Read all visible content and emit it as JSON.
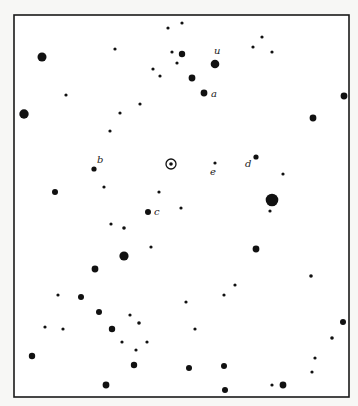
{
  "diagram": {
    "type": "star-map",
    "frame": {
      "x": 14,
      "y": 15,
      "width": 335,
      "height": 382
    },
    "sun": {
      "symbol": "⊙",
      "x": 171,
      "y": 164
    },
    "labels": [
      {
        "text": "u",
        "x": 214,
        "y": 54
      },
      {
        "text": "a",
        "x": 211,
        "y": 97
      },
      {
        "text": "b",
        "x": 97,
        "y": 163
      },
      {
        "text": "c",
        "x": 154,
        "y": 215
      },
      {
        "text": "d",
        "x": 245,
        "y": 167
      },
      {
        "text": "e",
        "x": 210,
        "y": 175
      }
    ],
    "stars": [
      {
        "x": 168,
        "y": 28,
        "r": 1.6
      },
      {
        "x": 182,
        "y": 23,
        "r": 1.6
      },
      {
        "x": 115,
        "y": 49,
        "r": 1.6
      },
      {
        "x": 42,
        "y": 57,
        "r": 4.5
      },
      {
        "x": 172,
        "y": 52,
        "r": 1.6
      },
      {
        "x": 182,
        "y": 54,
        "r": 3.2
      },
      {
        "x": 177,
        "y": 63,
        "r": 1.6
      },
      {
        "x": 215,
        "y": 64,
        "r": 4.3
      },
      {
        "x": 153,
        "y": 69,
        "r": 1.6
      },
      {
        "x": 160,
        "y": 76,
        "r": 1.6
      },
      {
        "x": 192,
        "y": 78,
        "r": 3.4
      },
      {
        "x": 204,
        "y": 93,
        "r": 3.4
      },
      {
        "x": 262,
        "y": 37,
        "r": 1.6
      },
      {
        "x": 253,
        "y": 47,
        "r": 1.6
      },
      {
        "x": 272,
        "y": 52,
        "r": 1.6
      },
      {
        "x": 66,
        "y": 95,
        "r": 1.6
      },
      {
        "x": 140,
        "y": 104,
        "r": 1.6
      },
      {
        "x": 120,
        "y": 113,
        "r": 1.6
      },
      {
        "x": 24,
        "y": 114,
        "r": 4.7
      },
      {
        "x": 344,
        "y": 96,
        "r": 3.4
      },
      {
        "x": 313,
        "y": 118,
        "r": 3.4
      },
      {
        "x": 110,
        "y": 131,
        "r": 1.6
      },
      {
        "x": 94,
        "y": 169,
        "r": 2.6
      },
      {
        "x": 215,
        "y": 163,
        "r": 1.6
      },
      {
        "x": 256,
        "y": 157,
        "r": 2.6
      },
      {
        "x": 283,
        "y": 174,
        "r": 1.6
      },
      {
        "x": 104,
        "y": 187,
        "r": 1.6
      },
      {
        "x": 55,
        "y": 192,
        "r": 3.0
      },
      {
        "x": 159,
        "y": 192,
        "r": 1.6
      },
      {
        "x": 272,
        "y": 200,
        "r": 6.3
      },
      {
        "x": 270,
        "y": 211,
        "r": 1.6
      },
      {
        "x": 148,
        "y": 212,
        "r": 3.0
      },
      {
        "x": 181,
        "y": 208,
        "r": 1.6
      },
      {
        "x": 111,
        "y": 224,
        "r": 1.6
      },
      {
        "x": 124,
        "y": 228,
        "r": 1.8
      },
      {
        "x": 151,
        "y": 247,
        "r": 1.6
      },
      {
        "x": 256,
        "y": 249,
        "r": 3.4
      },
      {
        "x": 124,
        "y": 256,
        "r": 4.6
      },
      {
        "x": 95,
        "y": 269,
        "r": 3.4
      },
      {
        "x": 311,
        "y": 276,
        "r": 1.8
      },
      {
        "x": 235,
        "y": 285,
        "r": 1.6
      },
      {
        "x": 224,
        "y": 295,
        "r": 1.6
      },
      {
        "x": 58,
        "y": 295,
        "r": 1.6
      },
      {
        "x": 81,
        "y": 297,
        "r": 3.0
      },
      {
        "x": 186,
        "y": 302,
        "r": 1.6
      },
      {
        "x": 99,
        "y": 312,
        "r": 3.0
      },
      {
        "x": 130,
        "y": 315,
        "r": 1.6
      },
      {
        "x": 343,
        "y": 322,
        "r": 3.0
      },
      {
        "x": 139,
        "y": 323,
        "r": 1.8
      },
      {
        "x": 45,
        "y": 327,
        "r": 1.6
      },
      {
        "x": 63,
        "y": 329,
        "r": 1.6
      },
      {
        "x": 112,
        "y": 329,
        "r": 3.2
      },
      {
        "x": 195,
        "y": 329,
        "r": 1.6
      },
      {
        "x": 332,
        "y": 338,
        "r": 1.8
      },
      {
        "x": 122,
        "y": 342,
        "r": 1.6
      },
      {
        "x": 147,
        "y": 342,
        "r": 1.6
      },
      {
        "x": 136,
        "y": 350,
        "r": 1.6
      },
      {
        "x": 32,
        "y": 356,
        "r": 3.2
      },
      {
        "x": 315,
        "y": 358,
        "r": 1.6
      },
      {
        "x": 134,
        "y": 365,
        "r": 3.2
      },
      {
        "x": 189,
        "y": 368,
        "r": 3.0
      },
      {
        "x": 224,
        "y": 366,
        "r": 3.0
      },
      {
        "x": 312,
        "y": 372,
        "r": 1.6
      },
      {
        "x": 106,
        "y": 385,
        "r": 3.4
      },
      {
        "x": 225,
        "y": 390,
        "r": 3.0
      },
      {
        "x": 272,
        "y": 385,
        "r": 1.6
      },
      {
        "x": 283,
        "y": 385,
        "r": 3.4
      }
    ]
  }
}
